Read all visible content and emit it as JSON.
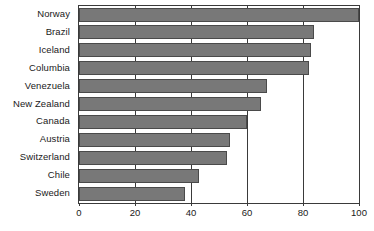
{
  "chart_data": {
    "type": "bar",
    "orientation": "horizontal",
    "title": "",
    "subtitle": "",
    "xlabel": "",
    "ylabel": "",
    "categories": [
      "Norway",
      "Brazil",
      "Iceland",
      "Columbia",
      "Venezuela",
      "New Zealand",
      "Canada",
      "Austria",
      "Switzerland",
      "Chile",
      "Sweden"
    ],
    "values": [
      100,
      84,
      83,
      82,
      67,
      65,
      60,
      54,
      53,
      43,
      38
    ],
    "xlim": [
      0,
      100
    ],
    "xticks": [
      0,
      20,
      40,
      60,
      80,
      100
    ],
    "xtick_labels": [
      "0",
      "20",
      "40",
      "60",
      "80",
      "100"
    ],
    "grid": true,
    "grid_axis": "x",
    "legend": false,
    "legend_position": "none",
    "bar_color": "#787878",
    "bar_edge_color": "#4a4a4a",
    "axis_color": "#3a3a3a",
    "background_color": "#ffffff",
    "text_color": "#1a1a1a"
  }
}
